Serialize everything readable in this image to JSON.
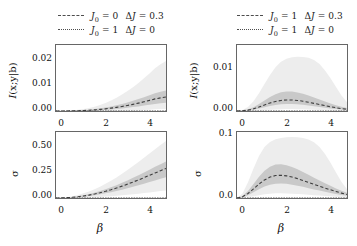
{
  "figure": {
    "panels": [
      {
        "id": "top-left",
        "legend": [
          {
            "style": "dashed",
            "label_html": "J0 = 0  ΔJ = 0.3",
            "J0": "0",
            "dJ": "0.3"
          },
          {
            "style": "dotted",
            "label_html": "J0 = 1  ΔJ = 0",
            "J0": "1",
            "dJ": "0"
          }
        ]
      }
    ]
  },
  "legend_left": {
    "rows": [
      {
        "J0": "0",
        "dJ": "0.3",
        "style": "dashed"
      },
      {
        "J0": "1",
        "dJ": "0",
        "style": "dotted"
      }
    ]
  },
  "legend_right": {
    "rows": [
      {
        "J0": "1",
        "dJ": "0.3",
        "style": "dashed"
      },
      {
        "J0": "1",
        "dJ": "0",
        "style": "dotted"
      }
    ]
  },
  "symbols": {
    "J": "J",
    "delta": "Δ",
    "eq": "=",
    "beta": "β",
    "sigma": "σ",
    "mi_label": "I(x;y|b)"
  },
  "chart_data": [
    {
      "type": "line",
      "id": "top-left",
      "title": "",
      "xlabel": "",
      "ylabel": "I(x;y|b)",
      "xlim": [
        0,
        5
      ],
      "ylim": [
        0,
        0.025
      ],
      "xticks": [
        0,
        2,
        4
      ],
      "xticklabels": [
        "0",
        "2",
        "4"
      ],
      "yticks": [
        0.0,
        0.01,
        0.02
      ],
      "yticklabels": [
        "0.00",
        "0.01",
        "0.02"
      ],
      "grid": false,
      "legend_position": "above",
      "x": [
        0,
        0.25,
        0.5,
        0.75,
        1.0,
        1.25,
        1.5,
        1.75,
        2.0,
        2.25,
        2.5,
        2.75,
        3.0,
        3.25,
        3.5,
        3.75,
        4.0,
        4.25,
        4.5,
        4.75,
        5.0
      ],
      "series": [
        {
          "name": "J0 = 0  dJ = 0.3",
          "style": "dashed",
          "values": [
            0.0,
            0.0,
            2e-05,
            5e-05,
            0.0001,
            0.00018,
            0.00028,
            0.00042,
            0.0006,
            0.00082,
            0.00108,
            0.00138,
            0.00172,
            0.0021,
            0.00252,
            0.00298,
            0.00348,
            0.00402,
            0.00458,
            0.00498,
            0.0053
          ],
          "band_inner_low": [
            0.0,
            0.0,
            0.0,
            2e-05,
            5e-05,
            9e-05,
            0.00015,
            0.00023,
            0.00033,
            0.00046,
            0.00061,
            0.00079,
            0.00099,
            0.00122,
            0.00147,
            0.00174,
            0.00204,
            0.00236,
            0.00269,
            0.00293,
            0.00312
          ],
          "band_inner_high": [
            0.0,
            1e-05,
            5e-05,
            0.0001,
            0.00019,
            0.00032,
            0.0005,
            0.00072,
            0.001,
            0.00134,
            0.00173,
            0.00218,
            0.00268,
            0.00324,
            0.00385,
            0.00451,
            0.00522,
            0.00598,
            0.00676,
            0.00733,
            0.00777
          ],
          "band_outer_low": [
            0.0,
            0.0,
            0.0,
            0.0,
            0.0,
            0.0,
            0.0,
            0.0,
            1e-05,
            2e-05,
            4e-05,
            7e-05,
            0.00011,
            0.00016,
            0.00022,
            0.0003,
            0.00039,
            0.0005,
            0.00062,
            0.00072,
            0.0008
          ],
          "band_outer_high": [
            0.0,
            2e-05,
            0.0001,
            0.00023,
            0.00043,
            0.00072,
            0.00112,
            0.00163,
            0.00227,
            0.00305,
            0.00397,
            0.00502,
            0.00622,
            0.00756,
            0.00903,
            0.01064,
            0.01238,
            0.01425,
            0.01623,
            0.01772,
            0.0189
          ]
        },
        {
          "name": "J0 = 1  dJ = 0",
          "style": "dotted",
          "values": [
            0,
            0,
            0,
            0,
            0,
            0,
            0,
            0,
            0,
            0,
            0,
            0,
            0,
            0,
            0,
            0,
            0,
            0,
            0,
            0,
            0
          ]
        }
      ]
    },
    {
      "type": "line",
      "id": "bottom-left",
      "title": "",
      "xlabel": "β",
      "ylabel": "σ",
      "xlim": [
        0,
        5
      ],
      "ylim": [
        0,
        0.6
      ],
      "xticks": [
        0,
        2,
        4
      ],
      "xticklabels": [
        "0",
        "2",
        "4"
      ],
      "yticks": [
        0.0,
        0.25,
        0.5
      ],
      "yticklabels": [
        "0.00",
        "0.25",
        "0.50"
      ],
      "grid": false,
      "legend_position": "none",
      "x": [
        0,
        0.25,
        0.5,
        0.75,
        1.0,
        1.25,
        1.5,
        1.75,
        2.0,
        2.25,
        2.5,
        2.75,
        3.0,
        3.25,
        3.5,
        3.75,
        4.0,
        4.25,
        4.5,
        4.75,
        5.0
      ],
      "series": [
        {
          "name": "J0 = 0  dJ = 0.3",
          "style": "dashed",
          "values": [
            0.0,
            0.0008,
            0.003,
            0.0065,
            0.0115,
            0.018,
            0.0262,
            0.036,
            0.0475,
            0.0605,
            0.075,
            0.091,
            0.108,
            0.126,
            0.145,
            0.1645,
            0.185,
            0.206,
            0.2275,
            0.248,
            0.268
          ],
          "band_inner_low": [
            0.0,
            0.0004,
            0.0018,
            0.0042,
            0.0078,
            0.0124,
            0.0182,
            0.0252,
            0.0333,
            0.0425,
            0.0527,
            0.064,
            0.076,
            0.0887,
            0.102,
            0.1158,
            0.1302,
            0.145,
            0.1602,
            0.1748,
            0.189
          ],
          "band_inner_high": [
            0.0,
            0.0013,
            0.0046,
            0.0096,
            0.0165,
            0.0253,
            0.036,
            0.0487,
            0.0632,
            0.0795,
            0.0975,
            0.117,
            0.138,
            0.16,
            0.183,
            0.2068,
            0.2315,
            0.257,
            0.283,
            0.3075,
            0.331
          ],
          "band_outer_low": [
            0.0,
            0.0001,
            0.0004,
            0.001,
            0.002,
            0.0033,
            0.005,
            0.0072,
            0.0098,
            0.0128,
            0.0162,
            0.02,
            0.0242,
            0.0288,
            0.0337,
            0.039,
            0.0446,
            0.0505,
            0.0568,
            0.0627,
            0.0683
          ],
          "band_outer_high": [
            0.0,
            0.0022,
            0.0078,
            0.0163,
            0.0278,
            0.0423,
            0.0597,
            0.08,
            0.103,
            0.1288,
            0.157,
            0.1875,
            0.22,
            0.2543,
            0.29,
            0.3268,
            0.3648,
            0.404,
            0.4442,
            0.482,
            0.518
          ]
        },
        {
          "name": "J0 = 1  dJ = 0",
          "style": "dotted",
          "values": [
            0,
            0,
            0,
            0,
            0,
            0,
            0,
            0,
            0,
            0,
            0,
            0,
            0,
            0,
            0,
            0,
            0,
            0,
            0,
            0,
            0
          ]
        }
      ]
    },
    {
      "type": "line",
      "id": "top-right",
      "title": "",
      "xlabel": "",
      "ylabel": "I(x;y|b)",
      "xlim": [
        0,
        5
      ],
      "ylim": [
        0,
        0.0145
      ],
      "xticks": [
        0,
        2,
        4
      ],
      "xticklabels": [
        "0",
        "2",
        "4"
      ],
      "yticks": [
        0.0,
        0.01
      ],
      "yticklabels": [
        "0.00",
        "0.01"
      ],
      "grid": false,
      "legend_position": "above",
      "x": [
        0,
        0.25,
        0.5,
        0.75,
        1.0,
        1.25,
        1.5,
        1.75,
        2.0,
        2.25,
        2.5,
        2.75,
        3.0,
        3.25,
        3.5,
        3.75,
        4.0,
        4.25,
        4.5,
        4.75,
        5.0
      ],
      "series": [
        {
          "name": "J0 = 1  dJ = 0.3",
          "style": "dashed",
          "values": [
            0.0,
            4e-05,
            0.0002,
            0.00048,
            0.00088,
            0.00133,
            0.00176,
            0.0021,
            0.00232,
            0.00243,
            0.00242,
            0.00232,
            0.00215,
            0.00193,
            0.00168,
            0.00143,
            0.00118,
            0.00094,
            0.00072,
            0.00053,
            0.00038
          ],
          "band_inner_low": [
            0.0,
            2e-05,
            0.00011,
            0.00028,
            0.00053,
            0.00082,
            0.0011,
            0.00133,
            0.00148,
            0.00155,
            0.00154,
            0.00147,
            0.00136,
            0.00121,
            0.00105,
            0.00088,
            0.00072,
            0.00057,
            0.00043,
            0.00031,
            0.00022
          ],
          "band_inner_high": [
            0.0,
            8e-05,
            0.00036,
            0.00085,
            0.00152,
            0.0023,
            0.00305,
            0.00368,
            0.0041,
            0.0043,
            0.00428,
            0.00409,
            0.00378,
            0.00339,
            0.00295,
            0.0025,
            0.00207,
            0.00165,
            0.00127,
            0.00094,
            0.00067
          ],
          "band_outer_low": [
            0.0,
            0.0,
            2e-05,
            6e-05,
            0.00012,
            0.0002,
            0.00028,
            0.00035,
            0.0004,
            0.00042,
            0.00042,
            0.0004,
            0.00037,
            0.00033,
            0.00028,
            0.00023,
            0.00019,
            0.00015,
            0.00011,
            8e-05,
            5e-05
          ],
          "band_outer_high": [
            0.0,
            0.0002,
            0.0009,
            0.00215,
            0.0039,
            0.00595,
            0.0079,
            0.0096,
            0.0108,
            0.0115,
            0.0118,
            0.0119,
            0.01185,
            0.0117,
            0.0112,
            0.0103,
            0.0089,
            0.0072,
            0.0053,
            0.0034,
            0.0019
          ]
        },
        {
          "name": "J0 = 1  dJ = 0",
          "style": "dotted",
          "values": [
            0,
            0,
            0,
            0,
            0,
            0,
            0,
            0,
            0,
            0,
            0,
            0,
            0,
            0,
            0,
            0,
            0,
            0,
            0,
            0,
            0
          ]
        }
      ]
    },
    {
      "type": "line",
      "id": "bottom-right",
      "title": "",
      "xlabel": "β",
      "ylabel": "σ",
      "xlim": [
        0,
        5
      ],
      "ylim": [
        0,
        0.105
      ],
      "xticks": [
        0,
        2,
        4
      ],
      "xticklabels": [
        "0",
        "2",
        "4"
      ],
      "yticks": [
        0.0,
        0.1
      ],
      "yticklabels": [
        "0.0",
        "0.1"
      ],
      "grid": false,
      "legend_position": "none",
      "x": [
        0,
        0.25,
        0.5,
        0.75,
        1.0,
        1.25,
        1.5,
        1.75,
        2.0,
        2.25,
        2.5,
        2.75,
        3.0,
        3.25,
        3.5,
        3.75,
        4.0,
        4.25,
        4.5,
        4.75,
        5.0
      ],
      "series": [
        {
          "name": "J0 = 1  dJ = 0.3",
          "style": "dashed",
          "values": [
            0.0,
            0.002,
            0.0072,
            0.0145,
            0.0222,
            0.0288,
            0.0333,
            0.0357,
            0.0362,
            0.0352,
            0.0333,
            0.0308,
            0.0278,
            0.0248,
            0.0217,
            0.0187,
            0.0158,
            0.013,
            0.0103,
            0.0078,
            0.0055
          ],
          "band_inner_low": [
            0.0,
            0.0012,
            0.0044,
            0.009,
            0.014,
            0.0183,
            0.0212,
            0.0228,
            0.0231,
            0.0225,
            0.0212,
            0.0196,
            0.0177,
            0.0157,
            0.0137,
            0.0118,
            0.0099,
            0.0081,
            0.0064,
            0.0048,
            0.0034
          ],
          "band_inner_high": [
            0.0,
            0.0032,
            0.0112,
            0.0222,
            0.0337,
            0.0433,
            0.0498,
            0.0532,
            0.0538,
            0.0523,
            0.0494,
            0.0457,
            0.0414,
            0.0369,
            0.0323,
            0.0278,
            0.0234,
            0.0193,
            0.0153,
            0.0116,
            0.0082
          ],
          "band_outer_low": [
            0.0,
            0.0004,
            0.0014,
            0.0029,
            0.0045,
            0.0059,
            0.0069,
            0.0074,
            0.0075,
            0.0073,
            0.0069,
            0.0064,
            0.0058,
            0.0051,
            0.0045,
            0.0038,
            0.0032,
            0.0026,
            0.0021,
            0.0016,
            0.0011
          ],
          "band_outer_high": [
            0.0,
            0.0072,
            0.025,
            0.047,
            0.067,
            0.081,
            0.089,
            0.0935,
            0.0955,
            0.0965,
            0.097,
            0.0968,
            0.0955,
            0.093,
            0.0885,
            0.081,
            0.07,
            0.056,
            0.0405,
            0.0255,
            0.014
          ]
        },
        {
          "name": "J0 = 1  dJ = 0",
          "style": "dotted",
          "values": [
            0,
            0,
            0,
            0,
            0,
            0,
            0,
            0,
            0,
            0,
            0,
            0,
            0,
            0,
            0,
            0,
            0,
            0,
            0,
            0,
            0
          ]
        }
      ]
    }
  ],
  "colors": {
    "line": "#3d3d3d",
    "band_inner": "#c9c9c9",
    "band_outer": "#ededed",
    "axis": "#666666",
    "text": "#111111"
  }
}
